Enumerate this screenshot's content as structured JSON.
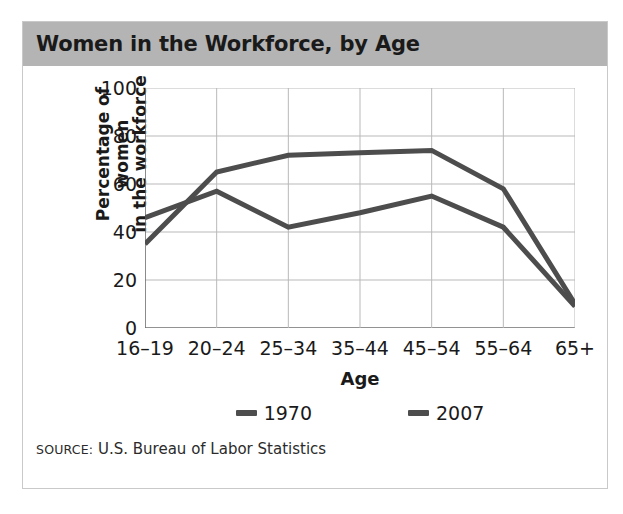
{
  "figure": {
    "title": "Women in the Workforce, by Age",
    "source_word": "SOURCE:",
    "source_text": " U.S. Bureau of Labor Statistics",
    "band_color": "#b4b4b4",
    "frame_color": "#c9c9c9"
  },
  "chart_data": {
    "type": "line",
    "title": "Women in the Workforce, by Age",
    "xlabel": "Age",
    "ylabel": "Percentage of women in the workforce",
    "ylabel_line1": "Percentage of women",
    "ylabel_line2": "in the workforce",
    "categories": [
      "16–19",
      "20–24",
      "25–34",
      "35–44",
      "45–54",
      "55–64",
      "65+"
    ],
    "ylim": [
      0,
      100
    ],
    "yticks": [
      0,
      20,
      40,
      60,
      80,
      100
    ],
    "ytick_labels": [
      "0",
      "20",
      "40",
      "60",
      "80",
      "100"
    ],
    "grid": true,
    "legend_position": "bottom",
    "series": [
      {
        "name": "1970",
        "color": "#4d4d4d",
        "values": [
          46,
          57,
          42,
          48,
          55,
          42,
          9
        ]
      },
      {
        "name": "2007",
        "color": "#4d4d4d",
        "values": [
          35,
          65,
          72,
          73,
          74,
          58,
          10
        ]
      }
    ],
    "grid_color": "#b9b9b9",
    "axis_color": "#6e6e6e",
    "source": "SOURCE: U.S. Bureau of Labor Statistics"
  }
}
